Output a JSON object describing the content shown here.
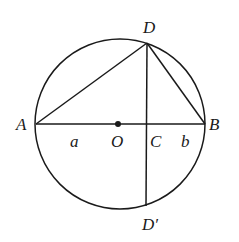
{
  "figure": {
    "type": "geometry",
    "colors": {
      "stroke": "#1a1a1a",
      "background": "#ffffff"
    },
    "circle": {
      "cx": 120,
      "cy": 124,
      "r": 85
    },
    "points": {
      "A": {
        "x": 36,
        "y": 124
      },
      "B": {
        "x": 205,
        "y": 124
      },
      "O": {
        "x": 118,
        "y": 124
      },
      "C": {
        "x": 147,
        "y": 124
      },
      "D": {
        "x": 147,
        "y": 43
      },
      "D_prime": {
        "x": 146,
        "y": 206
      }
    },
    "segments": [
      [
        "A",
        "B"
      ],
      [
        "A",
        "D"
      ],
      [
        "D",
        "B"
      ],
      [
        "D",
        "D_prime"
      ]
    ],
    "labels": {
      "A": "A",
      "B": "B",
      "O": "O",
      "C": "C",
      "D": "D",
      "D_prime": "D′",
      "a": "a",
      "b": "b"
    }
  }
}
